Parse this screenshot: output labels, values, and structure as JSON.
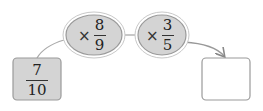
{
  "diagram": {
    "start": {
      "numerator": "7",
      "denominator": "10"
    },
    "operations": [
      {
        "symbol": "×",
        "numerator": "8",
        "denominator": "9"
      },
      {
        "symbol": "×",
        "numerator": "3",
        "denominator": "5"
      }
    ],
    "result": {
      "value": ""
    },
    "colors": {
      "fill": "#d4d4d4",
      "stroke": "#9a9a9a",
      "result_fill": "#ffffff"
    }
  }
}
